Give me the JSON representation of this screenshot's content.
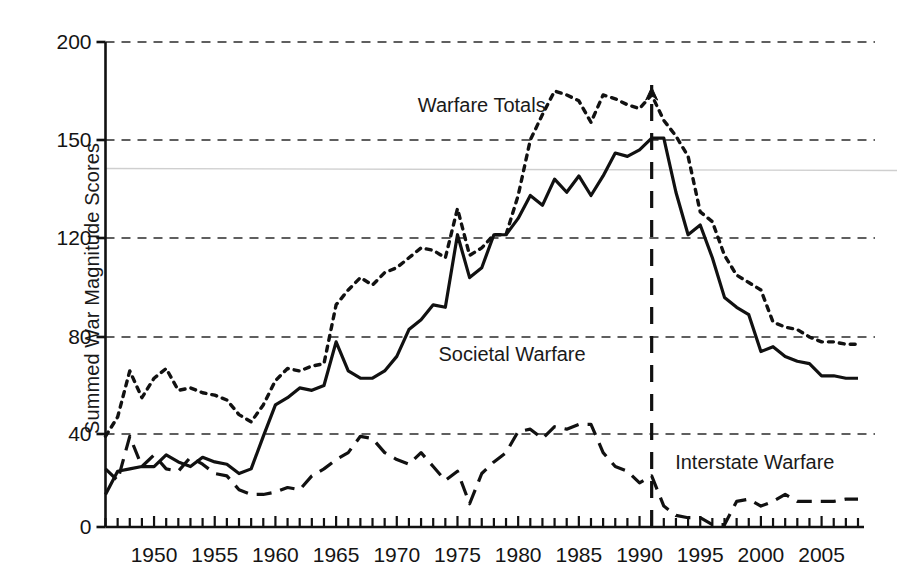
{
  "chart_data": {
    "type": "line",
    "title": "",
    "xlabel": "",
    "ylabel": "Summed War Magnitude Scores",
    "xlim": [
      1946,
      2008
    ],
    "ylim": [
      0,
      200
    ],
    "grid": true,
    "gridlines_y": [
      0,
      40,
      80,
      120,
      150,
      200
    ],
    "ytick_labels": [
      "0",
      "40",
      "80",
      "120",
      "150",
      "200"
    ],
    "xtick_labels": [
      "1950",
      "1955",
      "1960",
      "1965",
      "1970",
      "1975",
      "1980",
      "1985",
      "1990",
      "1995",
      "2000",
      "2005"
    ],
    "xtick_values": [
      1950,
      1955,
      1960,
      1965,
      1970,
      1975,
      1980,
      1985,
      1990,
      1995,
      2000,
      2005
    ],
    "xtick_minor_step": 1,
    "legend_position": "inline-annotations",
    "annotations": [
      {
        "text": "Warfare Totals",
        "x": 1977,
        "y": 168,
        "series": "warfare_totals"
      },
      {
        "text": "Societal Warfare",
        "x": 1979.5,
        "y": 73,
        "series": "societal_warfare"
      },
      {
        "text": "Interstate Warfare",
        "x": 1999.5,
        "y": 28,
        "series": "interstate_warfare"
      }
    ],
    "marker_line": {
      "x": 1991,
      "label": "",
      "style": "dashed-vertical",
      "arrow_tip": true
    },
    "x": [
      1946,
      1947,
      1948,
      1949,
      1950,
      1951,
      1952,
      1953,
      1954,
      1955,
      1956,
      1957,
      1958,
      1959,
      1960,
      1961,
      1962,
      1963,
      1964,
      1965,
      1966,
      1967,
      1968,
      1969,
      1970,
      1971,
      1972,
      1973,
      1974,
      1975,
      1976,
      1977,
      1978,
      1979,
      1980,
      1981,
      1982,
      1983,
      1984,
      1985,
      1986,
      1987,
      1988,
      1989,
      1990,
      1991,
      1992,
      1993,
      1994,
      1995,
      1996,
      1997,
      1998,
      1999,
      2000,
      2001,
      2002,
      2003,
      2004,
      2005,
      2006,
      2007,
      2008
    ],
    "series": [
      {
        "name": "Warfare Totals",
        "key": "warfare_totals",
        "style": "dotted",
        "color": "#111111",
        "values": [
          39,
          47,
          66,
          55,
          63,
          67,
          58,
          59,
          57,
          56,
          54,
          48,
          45,
          52,
          62,
          67,
          66,
          68,
          69,
          93,
          99,
          104,
          101,
          106,
          108,
          112,
          116,
          115,
          112,
          129,
          113,
          116,
          121,
          121,
          133,
          150,
          163,
          175,
          173,
          170,
          159,
          173,
          171,
          168,
          166,
          173,
          160,
          152,
          145,
          128,
          125,
          113,
          105,
          102,
          99,
          86,
          84,
          83,
          80,
          78,
          78,
          77,
          77
        ]
      },
      {
        "name": "Societal Warfare",
        "key": "societal_warfare",
        "style": "solid",
        "color": "#111111",
        "values": [
          14,
          24,
          25,
          26,
          26,
          31,
          28,
          26,
          30,
          28,
          27,
          23,
          25,
          39,
          52,
          55,
          59,
          58,
          60,
          78,
          66,
          63,
          63,
          66,
          72,
          83,
          87,
          93,
          92,
          121,
          104,
          108,
          121,
          121,
          126,
          133,
          130,
          138,
          134,
          139,
          133,
          139,
          146,
          145,
          147,
          151,
          151,
          134,
          121,
          124,
          112,
          96,
          92,
          89,
          74,
          76,
          72,
          70,
          69,
          64,
          64,
          63,
          63
        ]
      },
      {
        "name": "Interstate Warfare",
        "key": "interstate_warfare",
        "style": "dashed",
        "color": "#111111",
        "values": [
          25,
          20,
          39,
          26,
          31,
          25,
          24,
          30,
          27,
          23,
          22,
          16,
          14,
          14,
          15,
          17,
          16,
          22,
          25,
          29,
          32,
          39,
          38,
          32,
          29,
          27,
          32,
          26,
          20,
          24,
          10,
          23,
          28,
          32,
          41,
          42,
          38,
          43,
          42,
          44,
          44,
          32,
          26,
          24,
          19,
          22,
          9,
          5,
          4,
          4,
          1,
          1,
          11,
          12,
          9,
          11,
          14,
          11,
          11,
          11,
          11,
          12,
          12
        ]
      }
    ]
  },
  "ui": {
    "page_type": "figure",
    "background_color": "#ffffff",
    "ink_color": "#111111"
  }
}
